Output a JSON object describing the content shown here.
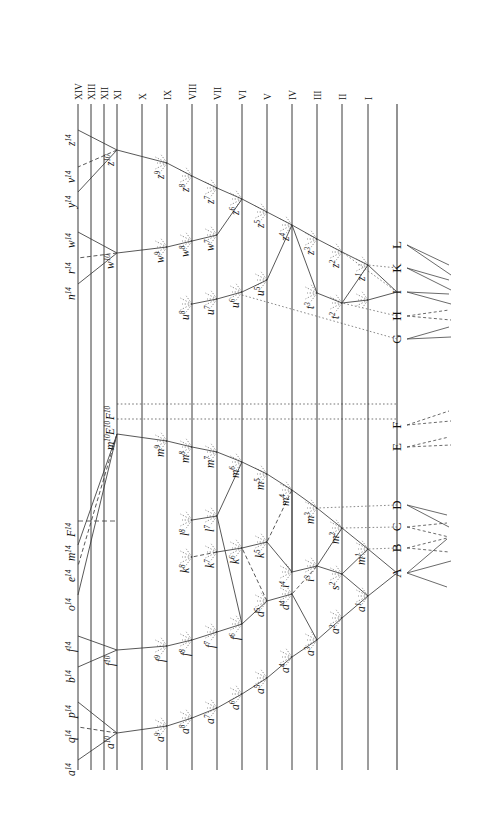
{
  "figure": {
    "orientation": "rotated-90",
    "line_color": "#3a3a3a",
    "text_color": "#111111",
    "background": "#ffffff"
  },
  "generation_axis": {
    "name": "generation-lines",
    "labels": [
      "XIV",
      "XIII",
      "XII",
      "XI",
      "X",
      "IX",
      "VIII",
      "VII",
      "VI",
      "V",
      "IV",
      "III",
      "II",
      "I"
    ]
  },
  "baseline": {
    "name": "species-baseline",
    "species": [
      "A",
      "B",
      "C",
      "D",
      "E",
      "F",
      "G",
      "H",
      "I",
      "K",
      "L"
    ]
  },
  "rows": {
    "XIV": [
      "a14",
      "q14",
      "p14",
      "b14",
      "f14",
      "o14",
      "e14",
      "m14",
      "F14",
      "n14",
      "r14",
      "w14",
      "y14",
      "v14",
      "z14"
    ],
    "XI": [
      "a10",
      "f10",
      "m10",
      "E10",
      "F10",
      "w10",
      "z10"
    ],
    "X": [],
    "IX": [
      "a9",
      "f9",
      "m9",
      "w9",
      "z9"
    ],
    "VIII": [
      "a8",
      "f8",
      "k8",
      "l8",
      "m8",
      "u8",
      "w8",
      "z8"
    ],
    "VII": [
      "a7",
      "f7",
      "k7",
      "l7",
      "m7",
      "u7",
      "w7",
      "z7"
    ],
    "VI": [
      "a6",
      "f6",
      "k6",
      "m6",
      "u6",
      "z6"
    ],
    "V": [
      "a5",
      "d5",
      "k5",
      "m5",
      "u5",
      "z5"
    ],
    "IV": [
      "a4",
      "d4",
      "i4",
      "m4",
      "z4"
    ],
    "III": [
      "a3",
      "i3",
      "m3",
      "t3",
      "z3"
    ],
    "II": [
      "a2",
      "s2",
      "m2",
      "t2",
      "z2"
    ],
    "I": [
      "a1",
      "m1",
      "z1"
    ]
  },
  "node_labels": {
    "a14": "a",
    "q14": "q",
    "p14": "p",
    "b14": "b",
    "f14": "f",
    "o14": "o",
    "e14": "e",
    "m14": "m",
    "F14": "F",
    "n14": "n",
    "r14": "r",
    "w14": "w",
    "y14": "y",
    "v14": "v",
    "z14": "z",
    "a10": "a",
    "f10": "f",
    "m10": "m",
    "E10": "E",
    "F10": "F",
    "w10": "w",
    "z10": "z",
    "a9": "a",
    "f9": "f",
    "m9": "m",
    "w9": "w",
    "z9": "z",
    "a8": "a",
    "f8": "f",
    "k8": "k",
    "l8": "l",
    "m8": "m",
    "u8": "u",
    "w8": "w",
    "z8": "z",
    "a7": "a",
    "f7": "f",
    "k7": "k",
    "l7": "l",
    "m7": "m",
    "u7": "u",
    "w7": "w",
    "z7": "z",
    "a6": "a",
    "f6": "f",
    "k6": "k",
    "m6": "m",
    "u6": "u",
    "z6": "z",
    "a5": "a",
    "d5": "d",
    "k5": "k",
    "m5": "m",
    "u5": "u",
    "z5": "z",
    "a4": "a",
    "d4": "d",
    "i4": "i",
    "m4": "m",
    "z4": "z",
    "a3": "a",
    "i3": "i",
    "m3": "m",
    "t3": "t",
    "z3": "z",
    "a2": "a",
    "s2": "s",
    "m2": "m",
    "t2": "t",
    "z2": "z",
    "a1": "a",
    "m1": "m",
    "z1": "z"
  },
  "node_supers": {
    "a14": "14",
    "q14": "14",
    "p14": "14",
    "b14": "14",
    "f14": "14",
    "o14": "14",
    "e14": "14",
    "m14": "14",
    "F14": "14",
    "n14": "14",
    "r14": "14",
    "w14": "14",
    "y14": "14",
    "v14": "14",
    "z14": "14",
    "a10": "10",
    "f10": "10",
    "m10": "10",
    "E10": "10",
    "F10": "10",
    "w10": "10",
    "z10": "10",
    "a9": "9",
    "f9": "9",
    "m9": "9",
    "w9": "9",
    "z9": "9",
    "a8": "8",
    "f8": "8",
    "k8": "8",
    "l8": "8",
    "m8": "8",
    "u8": "8",
    "w8": "8",
    "z8": "8",
    "a7": "7",
    "f7": "7",
    "k7": "7",
    "l7": "7",
    "m7": "7",
    "u7": "7",
    "w7": "7",
    "z7": "7",
    "a6": "6",
    "f6": "6",
    "k6": "6",
    "m6": "6",
    "u6": "6",
    "z6": "6",
    "a5": "5",
    "d5": "5",
    "k5": "5",
    "m5": "5",
    "u5": "5",
    "z5": "5",
    "a4": "4",
    "d4": "4",
    "i4": "4",
    "m4": "4",
    "z4": "4",
    "a3": "3",
    "i3": "3",
    "m3": "3",
    "t3": "3",
    "z3": "3",
    "a2": "2",
    "s2": "2",
    "m2": "2",
    "t2": "2",
    "z2": "2",
    "a1": "1",
    "m1": "1",
    "z1": "1"
  }
}
